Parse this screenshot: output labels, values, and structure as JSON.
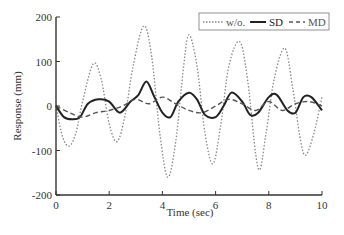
{
  "chart_data": {
    "type": "line",
    "title": "",
    "xlabel": "Time (sec)",
    "ylabel": "Response (mm)",
    "xlim": [
      0,
      10
    ],
    "ylim": [
      -200,
      200
    ],
    "xticks": [
      0,
      2,
      4,
      6,
      8,
      10
    ],
    "yticks": [
      200,
      100,
      0,
      -100,
      -200
    ],
    "grid": false,
    "legend_position": "top-right",
    "series": [
      {
        "name": "w/o.",
        "style": "dotted",
        "color": "#888888",
        "x": [
          0,
          0.25,
          0.5,
          0.75,
          1.0,
          1.4,
          1.7,
          2.0,
          2.3,
          2.6,
          2.9,
          3.3,
          3.6,
          3.9,
          4.2,
          4.5,
          4.8,
          5.0,
          5.3,
          5.6,
          5.9,
          6.2,
          6.5,
          6.9,
          7.2,
          7.6,
          7.9,
          8.2,
          8.6,
          8.9,
          9.2,
          9.4,
          9.7,
          10.0
        ],
        "y": [
          0,
          -70,
          -90,
          -60,
          10,
          95,
          60,
          -40,
          -80,
          -20,
          90,
          180,
          110,
          -60,
          -160,
          -80,
          90,
          160,
          90,
          -60,
          -130,
          -40,
          90,
          145,
          60,
          -140,
          -60,
          60,
          130,
          40,
          -80,
          -110,
          -60,
          20
        ]
      },
      {
        "name": "SD",
        "style": "solid",
        "color": "#222222",
        "x": [
          0,
          0.3,
          0.6,
          0.9,
          1.2,
          1.6,
          2.0,
          2.4,
          2.8,
          3.1,
          3.4,
          3.7,
          4.0,
          4.3,
          4.6,
          5.0,
          5.3,
          5.6,
          6.0,
          6.3,
          6.6,
          7.0,
          7.3,
          7.6,
          8.0,
          8.3,
          8.7,
          9.0,
          9.3,
          9.6,
          10.0
        ],
        "y": [
          0,
          -25,
          -30,
          -25,
          5,
          15,
          10,
          -15,
          10,
          25,
          55,
          20,
          -15,
          -25,
          10,
          30,
          15,
          -20,
          -25,
          0,
          30,
          10,
          -20,
          -15,
          20,
          25,
          -10,
          -15,
          20,
          20,
          -10
        ]
      },
      {
        "name": "MD",
        "style": "dashed",
        "color": "#555555",
        "x": [
          0,
          0.5,
          1.0,
          1.5,
          2.0,
          2.5,
          3.0,
          3.5,
          4.0,
          4.5,
          5.0,
          5.5,
          6.0,
          6.5,
          7.0,
          7.5,
          8.0,
          8.5,
          9.0,
          9.5,
          10.0
        ],
        "y": [
          0,
          -15,
          -25,
          -15,
          -10,
          0,
          15,
          5,
          20,
          5,
          -10,
          -15,
          0,
          15,
          5,
          -10,
          10,
          -10,
          5,
          10,
          0
        ]
      }
    ]
  },
  "axes": {
    "xlabel": "Time (sec)",
    "ylabel": "Response (mm)",
    "xtick_labels": [
      "0",
      "2",
      "4",
      "6",
      "8",
      "10"
    ],
    "ytick_labels": [
      "200",
      "100",
      "0",
      "-100",
      "-200"
    ]
  },
  "legend": {
    "items": [
      {
        "label": "w/o.",
        "style": "dotted"
      },
      {
        "label": "SD",
        "style": "solid"
      },
      {
        "label": "MD",
        "style": "dashed"
      }
    ]
  }
}
